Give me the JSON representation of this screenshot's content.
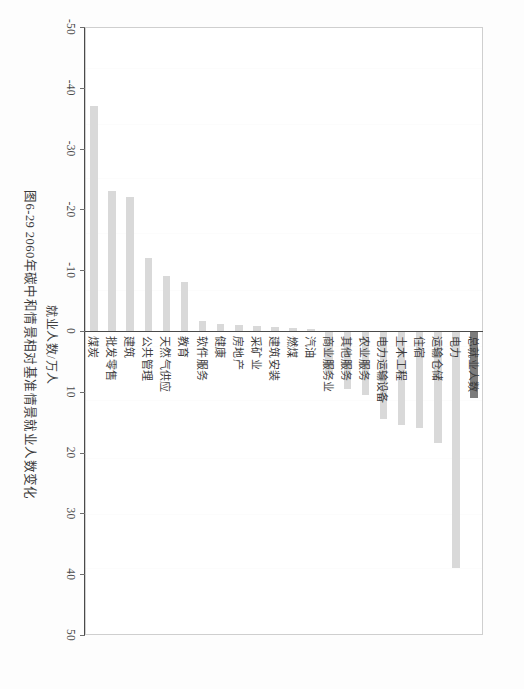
{
  "figure": {
    "caption": "图6-29  2060年碳中和情景相对基准情景就业人数变化",
    "axis_title": "就业人数/万人"
  },
  "colors": {
    "highlight_bar": "#7c7c7c",
    "normal_bar": "#d9d9d9",
    "axis": "#4a4a4a",
    "frame": "#cfcfcf",
    "text": "#3a3a3a"
  },
  "chart_data": {
    "type": "bar",
    "orientation": "vertical-rendered-rotated",
    "title": "图6-29  2060年碳中和情景相对基准情景就业人数变化",
    "xlabel": "",
    "ylabel": "就业人数/万人",
    "ylim": [
      -50,
      50
    ],
    "grid": false,
    "legend": "none",
    "tick_labels": [
      "50",
      "40",
      "30",
      "20",
      "10",
      "0",
      "-10",
      "-20",
      "-30",
      "-40",
      "-50"
    ],
    "ticks": [
      50,
      40,
      30,
      20,
      10,
      0,
      -10,
      -20,
      -30,
      -40,
      -50
    ],
    "categories": [
      "总就业人数",
      "电力",
      "运输仓储",
      "住宿",
      "土木工程",
      "电力运输设备",
      "农业服务",
      "其他服务",
      "商业服务业",
      "汽油",
      "燃煤",
      "建筑安装",
      "采矿业",
      "房地产",
      "健康",
      "软件服务",
      "教育",
      "天然气供应",
      "公共管理",
      "建筑",
      "批发零售",
      "煤炭"
    ],
    "values": [
      11.0,
      39.0,
      18.5,
      16.0,
      15.5,
      14.5,
      10.5,
      9.5,
      7.0,
      -0.4,
      -0.5,
      -0.6,
      -0.8,
      -1.0,
      -1.2,
      -1.6,
      -8.0,
      -9.0,
      -12.0,
      -22.0,
      -23.0,
      -37.0
    ],
    "highlight_index": 0,
    "series": [
      {
        "name": "就业人数变化",
        "values": [
          11.0,
          39.0,
          18.5,
          16.0,
          15.5,
          14.5,
          10.5,
          9.5,
          7.0,
          -0.4,
          -0.5,
          -0.6,
          -0.8,
          -1.0,
          -1.2,
          -1.6,
          -8.0,
          -9.0,
          -12.0,
          -22.0,
          -23.0,
          -37.0
        ]
      }
    ]
  }
}
